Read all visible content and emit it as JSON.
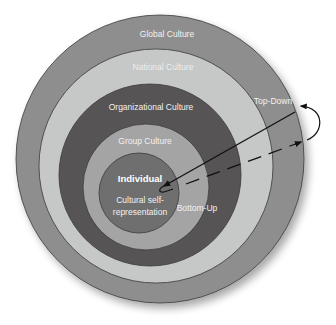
{
  "diagram": {
    "type": "nested-concentric-circles",
    "layers": [
      {
        "id": "global",
        "label": "Global Culture",
        "color": "#8e8e8e"
      },
      {
        "id": "national",
        "label": "National Culture",
        "color": "#c6c7c7"
      },
      {
        "id": "organizational",
        "label": "Organizational Culture",
        "color": "#575455"
      },
      {
        "id": "group",
        "label": "Group Culture",
        "color": "#a4a4a4"
      },
      {
        "id": "individual",
        "label": "Individual",
        "sublabel_line1": "Cultural self-",
        "sublabel_line2": "representation",
        "color": "#6f6f6f"
      }
    ],
    "arrows": {
      "top_down_label": "Top-Down",
      "bottom_up_label": "Bottom-Up",
      "color": "#111111"
    }
  }
}
